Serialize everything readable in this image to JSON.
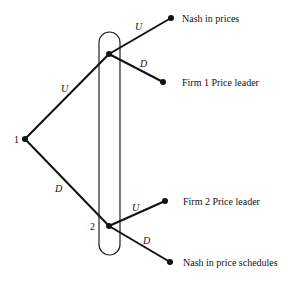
{
  "diagram": {
    "type": "game-tree",
    "info_set": {
      "x": 99,
      "y": 32,
      "width": 21,
      "height": 223,
      "rx": 10.5
    },
    "nodes": [
      {
        "id": "1",
        "label": "1",
        "x": 25,
        "y": 139
      },
      {
        "id": "2u",
        "label": "",
        "x": 109,
        "y": 54
      },
      {
        "id": "2d",
        "label": "2",
        "x": 109,
        "y": 226
      },
      {
        "id": "t1",
        "label": "Nash in prices",
        "x": 171,
        "y": 18
      },
      {
        "id": "t2",
        "label": "Firm 1 Price leader",
        "x": 163,
        "y": 82
      },
      {
        "id": "t3",
        "label": "Firm 2 Price leader",
        "x": 165,
        "y": 201
      },
      {
        "id": "t4",
        "label": "Nash in price schedules",
        "x": 170,
        "y": 262
      }
    ],
    "edges": [
      {
        "from": "1",
        "to": "2u",
        "label": "U"
      },
      {
        "from": "1",
        "to": "2d",
        "label": "D"
      },
      {
        "from": "2u",
        "to": "t1",
        "label": "U"
      },
      {
        "from": "2u",
        "to": "t2",
        "label": "D"
      },
      {
        "from": "2d",
        "to": "t3",
        "label": "U"
      },
      {
        "from": "2d",
        "to": "t4",
        "label": "D"
      }
    ],
    "labels": {
      "player1": "1",
      "player2": "2",
      "e_1_up": "U",
      "e_1_down": "D",
      "e_2u_up": "U",
      "e_2u_down": "D",
      "e_2d_up": "U",
      "e_2d_down": "D",
      "outcome_1": "Nash in prices",
      "outcome_2": "Firm 1 Price leader",
      "outcome_3": "Firm 2 Price leader",
      "outcome_4": "Nash in price schedules"
    }
  }
}
